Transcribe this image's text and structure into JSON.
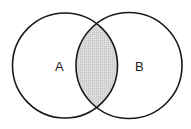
{
  "diagram": {
    "type": "venn",
    "sets": [
      {
        "label": "A",
        "cx": 65,
        "cy": 65.5,
        "r": 52.5
      },
      {
        "label": "B",
        "cx": 129,
        "cy": 65.5,
        "r": 53
      }
    ],
    "intersection": {
      "shaded": true,
      "fill": "#d6d6d6"
    },
    "stroke": "#1a1a1a",
    "background": "#ffffff"
  }
}
